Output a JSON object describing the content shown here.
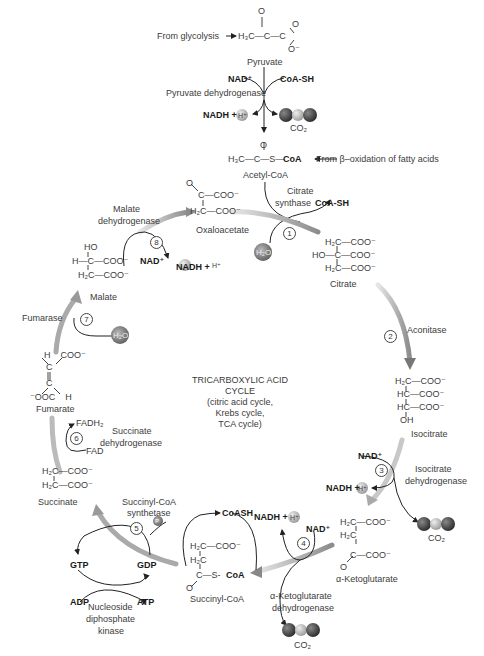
{
  "title": {
    "line1": "TRICARBOXYLIC ACID",
    "line2": "CYCLE",
    "line3": "(citric acid cycle,",
    "line4": "Krebs cycle,",
    "line5": "TCA cycle)"
  },
  "inputs": {
    "glycolysis": "From glycolysis",
    "beta_ox": "From β–oxidation of fatty acids"
  },
  "pyruvate": {
    "name": "Pyruvate",
    "formula_top": "O",
    "formula": "H₃C—C—C",
    "o_right": "O",
    "o_minus": "O⁻",
    "enzyme": "Pyruvate dehydrogenase",
    "nad": "NAD⁺",
    "coash": "CoA-SH",
    "nadh": "NADH +",
    "h": "H⁺",
    "co2": "CO₂"
  },
  "acetyl_coa": {
    "name": "Acetyl-CoA",
    "o": "O",
    "formula": "H₃C—C—S—",
    "coa": "CoA"
  },
  "molecules": {
    "oxaloacetate": {
      "name": "Oxaloacetate",
      "l1": "O",
      "l2": "C—COO⁻",
      "l3": "H₂C—COO⁻"
    },
    "citrate": {
      "name": "Citrate",
      "l1": "H₂C—COO⁻",
      "l2": "HO—C—COO⁻",
      "l3": "H₂C—COO⁻"
    },
    "isocitrate": {
      "name": "Isocitrate",
      "l1": "H₂C—COO⁻",
      "l2": "HC—COO⁻",
      "l3": "HC—COO⁻",
      "l4": "OH"
    },
    "akg": {
      "name": "α-Ketoglutarate",
      "l1": "H₂C—COO⁻",
      "l2": "H₂C",
      "l3": "C—COO⁻",
      "l4": "O"
    },
    "succinyl_coa": {
      "name": "Succinyl-CoA",
      "l1": "H₂C—COO⁻",
      "l2": "H₂C",
      "l3": "C—S-",
      "coa": "CoA",
      "l4": "O"
    },
    "succinate": {
      "name": "Succinate",
      "l1": "H₂C—COO⁻",
      "l2": "H₂C—COO⁻"
    },
    "fumarate": {
      "name": "Fumarate",
      "l1": "H    COO⁻",
      "l2": "C",
      "l3": "C",
      "l4": "⁻OOC    H"
    },
    "malate": {
      "name": "Malate",
      "l1": "HO",
      "l2": "H—C—COO⁻",
      "l3": "H₂C—COO⁻"
    }
  },
  "steps": [
    {
      "num": "1",
      "enzyme": "Citrate\nsynthase",
      "cofactors": [
        "H₂O",
        "CoA-SH"
      ]
    },
    {
      "num": "2",
      "enzyme": "Aconitase",
      "cofactors": []
    },
    {
      "num": "3",
      "enzyme": "Isocitrate\ndehydrogenase",
      "cofactors": [
        "NAD⁺",
        "NADH +",
        "H⁺",
        "CO₂"
      ]
    },
    {
      "num": "4",
      "enzyme": "α-Ketoglutarate\ndehydrogenase",
      "cofactors": [
        "NAD⁺",
        "NADH +",
        "H⁺",
        "CO₂",
        "CoASH"
      ]
    },
    {
      "num": "5",
      "enzyme": "Succinyl-CoA\nsynthetase",
      "cofactors": [
        "P",
        "GDP",
        "GTP"
      ]
    },
    {
      "num": "6",
      "enzyme": "Succinate\ndehydrogenase",
      "cofactors": [
        "FAD",
        "FADH₂"
      ]
    },
    {
      "num": "7",
      "enzyme": "Fumarase",
      "cofactors": [
        "H₂O"
      ]
    },
    {
      "num": "8",
      "enzyme": "Malate\ndehydrogenase",
      "cofactors": [
        "NAD⁺",
        "NADH +",
        "H⁺"
      ]
    }
  ],
  "labels": {
    "citrate_synthase_1": "Citrate",
    "citrate_synthase_2": "synthase",
    "coash_1": "CoA-SH",
    "h2o": "H₂O",
    "aconitase": "Aconitase",
    "idh_1": "Isocitrate",
    "idh_2": "dehydrogenase",
    "nad": "NAD⁺",
    "nadh": "NADH +",
    "h": "H⁺",
    "co2": "CO₂",
    "akgdh_1": "α-Ketoglutarate",
    "akgdh_2": "dehydrogenase",
    "coash_4": "CoASH",
    "scs_1": "Succinyl-CoA",
    "scs_2": "synthetase",
    "p": "P",
    "gtp": "GTP",
    "gdp": "GDP",
    "adp": "ADP",
    "atp": "ATP",
    "ndk_1": "Nucleoside",
    "ndk_2": "diphosphate",
    "ndk_3": "kinase",
    "sdh_1": "Succinate",
    "sdh_2": "dehydrogenase",
    "fad": "FAD",
    "fadh2": "FADH₂",
    "fumarase": "Fumarase",
    "mdh_1": "Malate",
    "mdh_2": "dehydrogenase"
  },
  "step_numbers": [
    "1",
    "2",
    "3",
    "4",
    "5",
    "6",
    "7",
    "8"
  ],
  "colors": {
    "arrow_gray": "#8a8a8a",
    "text": "#3c3c3c",
    "bold": "#1a1a1a",
    "co2_dark": "#3a3a3a",
    "co2_light": "#b5b5b5"
  }
}
